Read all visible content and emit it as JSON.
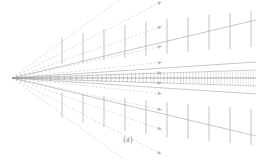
{
  "figure": {
    "caption": "(a)",
    "kind": "line-diagram",
    "background_color": "#ffffff",
    "stroke_color": "#9a9a9a",
    "stroke_color_dark": "#6f6f6f",
    "stroke_color_light": "#b9b9b9",
    "width": 256,
    "height": 160
  },
  "chart_data": {
    "type": "line",
    "title": "(a)",
    "xlabel": "",
    "ylabel": "",
    "grid": false,
    "legend": "none",
    "xlim": [
      0,
      256
    ],
    "ylim": [
      0,
      160
    ],
    "apex": {
      "x": 12,
      "y": 78
    },
    "rays": {
      "count": 12,
      "angles_deg": [
        -36,
        -27,
        -19,
        -12,
        -6,
        -2,
        2,
        6,
        12,
        19,
        27,
        36
      ],
      "dashed": true,
      "arrow_tipped": true
    },
    "envelopes": [
      {
        "name": "upper-outer",
        "x": [
          12,
          256
        ],
        "y": [
          78,
          20
        ]
      },
      {
        "name": "upper-inner",
        "x": [
          12,
          256
        ],
        "y": [
          78,
          62
        ]
      },
      {
        "name": "lower-inner",
        "x": [
          12,
          256
        ],
        "y": [
          78,
          94
        ]
      },
      {
        "name": "lower-outer",
        "x": [
          12,
          256
        ],
        "y": [
          78,
          136
        ]
      }
    ],
    "bands": [
      {
        "name": "upper-hatched-band",
        "y_start": 70,
        "y_end": 78,
        "ticks": 60
      },
      {
        "name": "lower-hatched-band",
        "y_start": 78,
        "y_end": 86,
        "ticks": 60
      }
    ],
    "comb_upper": {
      "count": 10,
      "x": [
        62,
        83,
        104,
        125,
        146,
        167,
        188,
        209,
        230,
        251
      ],
      "top_y": [
        38,
        33,
        29,
        25,
        22,
        19,
        17,
        15,
        13,
        11
      ],
      "base_y": [
        64,
        62,
        60,
        58,
        56,
        54,
        52,
        50,
        49,
        47
      ]
    },
    "comb_lower": {
      "count": 10,
      "x": [
        62,
        83,
        104,
        125,
        146,
        167,
        188,
        209,
        230,
        251
      ],
      "base_y": [
        92,
        94,
        96,
        98,
        100,
        102,
        104,
        106,
        107,
        109
      ],
      "bottom_y": [
        118,
        123,
        127,
        131,
        134,
        137,
        139,
        141,
        143,
        145
      ]
    }
  }
}
